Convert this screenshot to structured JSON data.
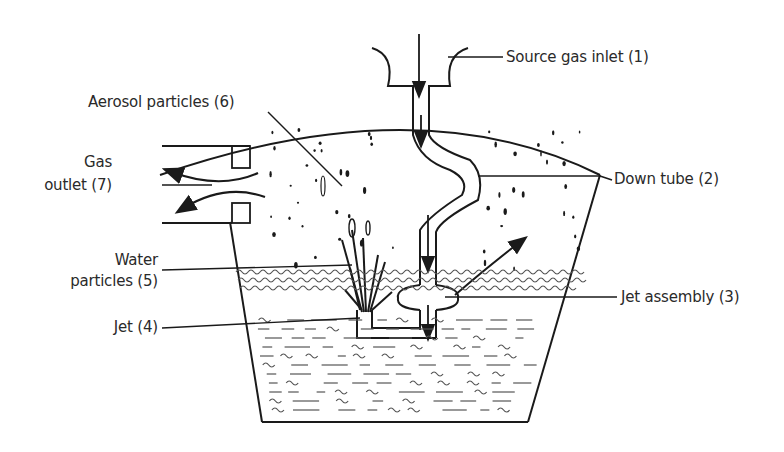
{
  "diagram": {
    "labels": {
      "source_gas_inlet": "Source gas inlet (1)",
      "down_tube": "Down tube (2)",
      "jet_assembly": "Jet assembly (3)",
      "jet": "Jet (4)",
      "water_particles_line1": "Water",
      "water_particles_line2": "particles (5)",
      "aerosol_particles": "Aerosol particles (6)",
      "gas_outlet_line1": "Gas",
      "gas_outlet_line2": "outlet (7)"
    },
    "colors": {
      "ink": "#1a1a1a",
      "water_hatch": "#555555",
      "background": "#ffffff"
    }
  }
}
